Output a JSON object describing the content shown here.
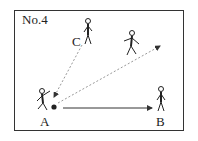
{
  "diagram": {
    "title": "No.4",
    "players": [
      {
        "id": "A",
        "label": "A",
        "role": "passer with ball"
      },
      {
        "id": "B",
        "label": "B",
        "role": "receiver (ground pass target)"
      },
      {
        "id": "C",
        "label": "C",
        "role": "player passing back to A"
      },
      {
        "id": "runner",
        "label": "",
        "role": "running player"
      }
    ],
    "arrows": [
      {
        "from": "C",
        "to": "A",
        "style": "dashed",
        "meaning": "pass back to A"
      },
      {
        "from": "A",
        "to": "upper-right space",
        "style": "dashed",
        "meaning": "through pass ahead of runner"
      },
      {
        "from": "A",
        "to": "B",
        "style": "solid",
        "meaning": "ground pass to B"
      }
    ],
    "colors": {
      "line": "#333333",
      "dashed": "#888888",
      "ball": "#222222"
    }
  }
}
